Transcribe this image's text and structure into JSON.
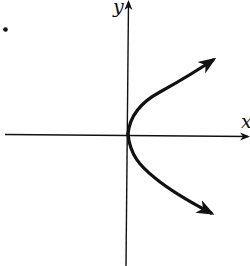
{
  "figure": {
    "type": "graph-sketch",
    "axes": {
      "x_label": "x",
      "y_label": "y"
    },
    "curve": {
      "shape": "parabola",
      "orientation": "opens-right",
      "vertex": "origin",
      "arrow_ends": [
        "upper-right",
        "lower-right"
      ]
    },
    "marker": {
      "type": "bullet-dot",
      "position": "top-left"
    },
    "colors": {
      "ink": "#111111",
      "background": "#ffffff"
    }
  }
}
